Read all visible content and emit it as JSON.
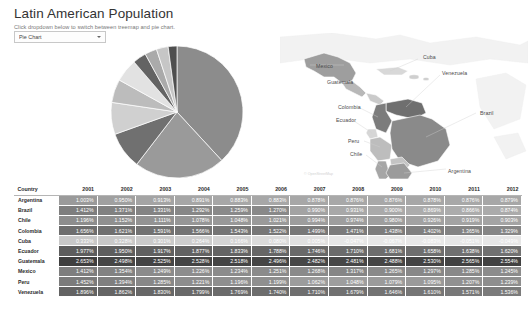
{
  "header": {
    "title": "Latin American Population",
    "subtitle": "Click dropdown below to switch between treemap and pie chart."
  },
  "controls": {
    "chart_type_dropdown": {
      "name": "chart-type-select",
      "selected": "Pie Chart",
      "options": [
        "Pie Chart",
        "Treemap"
      ],
      "caret_icon": "chevron-down-icon"
    }
  },
  "map": {
    "attribution": "© OpenStreetMap",
    "labels": [
      {
        "name": "Mexico",
        "x": 36,
        "y": 30
      },
      {
        "name": "Cuba",
        "x": 143,
        "y": 21
      },
      {
        "name": "Guatemala",
        "x": 47,
        "y": 46
      },
      {
        "name": "Venezuela",
        "x": 162,
        "y": 37
      },
      {
        "name": "Colombia",
        "x": 58,
        "y": 71
      },
      {
        "name": "Ecuador",
        "x": 56,
        "y": 84
      },
      {
        "name": "Brazil",
        "x": 200,
        "y": 77
      },
      {
        "name": "Peru",
        "x": 68,
        "y": 105
      },
      {
        "name": "Chile",
        "x": 70,
        "y": 118
      },
      {
        "name": "Argentina",
        "x": 168,
        "y": 135
      }
    ]
  },
  "chart_data": {
    "type": "pie",
    "title": "Latin American Population",
    "labels": [
      "Brazil",
      "Mexico",
      "Colombia",
      "Argentina",
      "Peru",
      "Venezuela",
      "Chile",
      "Ecuador",
      "Guatemala",
      "Cuba"
    ],
    "values": [
      200.4,
      117.1,
      47.7,
      41.1,
      30.0,
      29.8,
      17.4,
      15.5,
      15.1,
      11.3
    ],
    "units": "millions",
    "legend": "none",
    "slice_colors": [
      "#8c8c8c",
      "#9a9a9a",
      "#707070",
      "#d0d0d0",
      "#bcbcbc",
      "#e2e2e2",
      "#636363",
      "#aaaaaa",
      "#c6c6c6",
      "#4f4f4f"
    ]
  },
  "table": {
    "name": "population-growth-table",
    "columns": [
      "Country",
      "2001",
      "2002",
      "2003",
      "2004",
      "2005",
      "2006",
      "2007",
      "2008",
      "2009",
      "2010",
      "2011",
      "2012"
    ],
    "rows": [
      {
        "country": "Argentina",
        "values": [
          "1.003%",
          "0.950%",
          "0.913%",
          "0.891%",
          "0.883%",
          "0.883%",
          "0.878%",
          "0.876%",
          "0.876%",
          "0.878%",
          "0.876%",
          "0.879%"
        ]
      },
      {
        "country": "Brazil",
        "values": [
          "1.412%",
          "1.371%",
          "1.331%",
          "1.292%",
          "1.259%",
          "1.270%",
          "0.990%",
          "0.931%",
          "0.900%",
          "0.869%",
          "0.866%",
          "0.874%"
        ]
      },
      {
        "country": "Chile",
        "values": [
          "1.196%",
          "1.152%",
          "1.111%",
          "1.078%",
          "1.048%",
          "1.021%",
          "0.994%",
          "0.974%",
          "0.980%",
          "0.926%",
          "0.919%",
          "0.903%"
        ]
      },
      {
        "country": "Colombia",
        "values": [
          "1.656%",
          "1.621%",
          "1.591%",
          "1.566%",
          "1.543%",
          "1.522%",
          "1.499%",
          "1.471%",
          "1.438%",
          "1.402%",
          "1.365%",
          "1.329%"
        ]
      },
      {
        "country": "Cuba",
        "values": [
          "0.333%",
          "0.328%",
          "0.301%",
          "0.264%",
          "0.166%",
          "0.080%",
          "0.005%",
          "-0.047%",
          "-0.067%",
          "-0.083%",
          "-0.051%",
          "-0.049%"
        ]
      },
      {
        "country": "Ecuador",
        "values": [
          "1.977%",
          "1.950%",
          "1.917%",
          "1.877%",
          "1.833%",
          "1.788%",
          "1.746%",
          "1.710%",
          "1.681%",
          "1.658%",
          "1.638%",
          "1.620%"
        ]
      },
      {
        "country": "Guatemala",
        "values": [
          "2.653%",
          "2.498%",
          "2.525%",
          "2.528%",
          "2.518%",
          "2.496%",
          "2.482%",
          "2.481%",
          "2.488%",
          "2.530%",
          "2.565%",
          "2.554%"
        ]
      },
      {
        "country": "Mexico",
        "values": [
          "1.412%",
          "1.354%",
          "1.249%",
          "1.226%",
          "1.234%",
          "1.251%",
          "1.268%",
          "1.317%",
          "1.265%",
          "1.297%",
          "1.285%",
          "1.245%"
        ]
      },
      {
        "country": "Peru",
        "values": [
          "1.452%",
          "1.394%",
          "1.285%",
          "1.221%",
          "1.196%",
          "1.199%",
          "1.062%",
          "1.048%",
          "1.079%",
          "1.095%",
          "1.207%",
          "1.239%"
        ]
      },
      {
        "country": "Venezuela",
        "values": [
          "1.896%",
          "1.862%",
          "1.830%",
          "1.799%",
          "1.769%",
          "1.740%",
          "1.710%",
          "1.679%",
          "1.646%",
          "1.610%",
          "1.571%",
          "1.536%"
        ]
      }
    ],
    "heatmap_shades": [
      [
        "#9a9a9a",
        "#a0a0a0",
        "#a4a4a4",
        "#a6a6a6",
        "#a7a7a7",
        "#a7a7a7",
        "#a7a7a7",
        "#a8a8a8",
        "#a8a8a8",
        "#a7a7a7",
        "#a8a8a8",
        "#a7a7a7"
      ],
      [
        "#7e7e7e",
        "#818181",
        "#848484",
        "#878787",
        "#8a8a8a",
        "#898989",
        "#a3a3a3",
        "#a8a8a8",
        "#aaaaaa",
        "#acacac",
        "#acacac",
        "#ababab"
      ],
      [
        "#8d8d8d",
        "#909090",
        "#939393",
        "#969696",
        "#989898",
        "#9a9a9a",
        "#9d9d9d",
        "#9e9e9e",
        "#9e9e9e",
        "#a2a2a2",
        "#a3a3a3",
        "#a4a4a4"
      ],
      [
        "#6e6e6e",
        "#707070",
        "#727272",
        "#747474",
        "#757575",
        "#777777",
        "#787878",
        "#7b7b7b",
        "#7d7d7d",
        "#808080",
        "#838383",
        "#868686"
      ],
      [
        "#c8c8c8",
        "#c8c8c8",
        "#cacaca",
        "#cdcdcd",
        "#d4d4d4",
        "#dadada",
        "#e0e0e0",
        "#e6e6e6",
        "#e7e7e7",
        "#e8e8e8",
        "#e6e6e6",
        "#e6e6e6"
      ],
      [
        "#5d5d5d",
        "#5e5e5e",
        "#606060",
        "#626262",
        "#646464",
        "#666666",
        "#696969",
        "#6b6b6b",
        "#6d6d6d",
        "#6e6e6e",
        "#707070",
        "#717171"
      ],
      [
        "#3f3f3f",
        "#464646",
        "#444444",
        "#444444",
        "#454545",
        "#464646",
        "#474747",
        "#474747",
        "#464646",
        "#444444",
        "#424242",
        "#424242"
      ],
      [
        "#7e7e7e",
        "#828282",
        "#8b8b8b",
        "#8d8d8d",
        "#8c8c8c",
        "#8b8b8b",
        "#8a8a8a",
        "#868686",
        "#8a8a8a",
        "#888888",
        "#898989",
        "#8c8c8c"
      ],
      [
        "#7b7b7b",
        "#7f7f7f",
        "#888888",
        "#8d8d8d",
        "#8f8f8f",
        "#8f8f8f",
        "#9c9c9c",
        "#9e9e9e",
        "#9b9b9b",
        "#9a9a9a",
        "#919191",
        "#8e8e8e"
      ],
      [
        "#636363",
        "#656565",
        "#676767",
        "#696969",
        "#6b6b6b",
        "#6d6d6d",
        "#6f6f6f",
        "#717171",
        "#737373",
        "#767676",
        "#787878",
        "#7b7b7b"
      ]
    ]
  }
}
